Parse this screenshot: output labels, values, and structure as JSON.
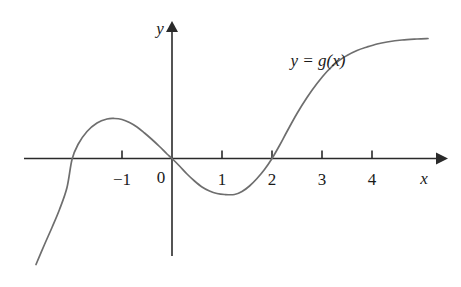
{
  "chart_data": {
    "type": "line",
    "title": "",
    "subtitle": "",
    "xlabel": "x",
    "ylabel": "y",
    "curve_label": "y = g(x)",
    "grid": false,
    "legend_position": "none",
    "xlim": [
      -3.0,
      5.4
    ],
    "ylim": [
      -2.2,
      2.7
    ],
    "x_ticks": [
      -1,
      0,
      1,
      2,
      3,
      4
    ],
    "x_tick_labels": [
      "−1",
      "0",
      "1",
      "2",
      "3",
      "4"
    ],
    "y_ticks": [],
    "y_tick_labels": [],
    "origin_label": "0",
    "x_axis_arrow": true,
    "y_axis_arrow": true,
    "features": {
      "x_intercepts": [
        -2,
        0,
        2
      ],
      "local_maximum": [
        -1.15,
        0.8
      ],
      "local_minimum": [
        1.25,
        -0.72
      ],
      "inflection_note": "rises steeply through x = 2 then flattens toward right edge"
    },
    "series": [
      {
        "name": "g(x)",
        "color": "#6e6e6e",
        "points": [
          [
            -2.72,
            -2.12
          ],
          [
            -2.55,
            -1.72
          ],
          [
            -2.4,
            -1.38
          ],
          [
            -2.25,
            -1.02
          ],
          [
            -2.1,
            -0.58
          ],
          [
            -2.0,
            -0.02
          ],
          [
            -1.88,
            0.28
          ],
          [
            -1.7,
            0.54
          ],
          [
            -1.5,
            0.71
          ],
          [
            -1.3,
            0.79
          ],
          [
            -1.15,
            0.8
          ],
          [
            -1.0,
            0.78
          ],
          [
            -0.85,
            0.72
          ],
          [
            -0.7,
            0.63
          ],
          [
            -0.55,
            0.51
          ],
          [
            -0.4,
            0.38
          ],
          [
            -0.25,
            0.24
          ],
          [
            -0.1,
            0.09
          ],
          [
            0.0,
            0.0
          ],
          [
            0.15,
            -0.15
          ],
          [
            0.3,
            -0.31
          ],
          [
            0.45,
            -0.45
          ],
          [
            0.6,
            -0.57
          ],
          [
            0.75,
            -0.65
          ],
          [
            0.9,
            -0.7
          ],
          [
            1.05,
            -0.72
          ],
          [
            1.25,
            -0.72
          ],
          [
            1.4,
            -0.66
          ],
          [
            1.55,
            -0.55
          ],
          [
            1.7,
            -0.4
          ],
          [
            1.85,
            -0.22
          ],
          [
            2.0,
            0.0
          ],
          [
            2.15,
            0.26
          ],
          [
            2.3,
            0.54
          ],
          [
            2.5,
            0.9
          ],
          [
            2.7,
            1.22
          ],
          [
            2.9,
            1.5
          ],
          [
            3.1,
            1.74
          ],
          [
            3.3,
            1.93
          ],
          [
            3.5,
            2.06
          ],
          [
            3.7,
            2.16
          ],
          [
            3.9,
            2.23
          ],
          [
            4.1,
            2.29
          ],
          [
            4.3,
            2.33
          ],
          [
            4.6,
            2.37
          ],
          [
            4.9,
            2.39
          ],
          [
            5.12,
            2.4
          ]
        ]
      }
    ]
  },
  "colors": {
    "curve": "#6e6e6e",
    "axis": "#2a2a2a",
    "text": "#1a1a1a",
    "background": "#ffffff"
  }
}
